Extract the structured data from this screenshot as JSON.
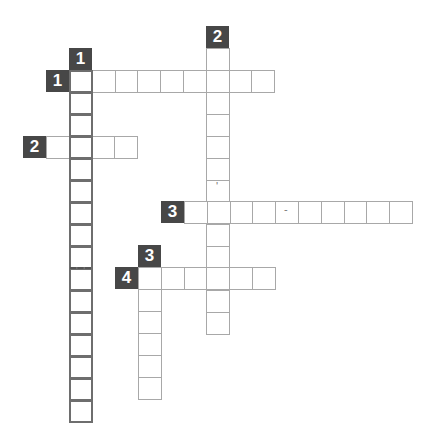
{
  "puzzle": {
    "cell_w": 22.8,
    "cell_h": 22,
    "colors": {
      "label_bg": "#474747",
      "label_fg": "#ffffff",
      "cell_border": "#a8a8a8",
      "dark_border": "#6e6e6e"
    },
    "entries": [
      {
        "id": "1-down",
        "number": "1",
        "direction": "down",
        "label_x": 69,
        "label_y": 48,
        "x": 69,
        "y": 70,
        "length": 16,
        "dark": true
      },
      {
        "id": "1-across",
        "number": "1",
        "direction": "across",
        "label_x": 46,
        "label_y": 70,
        "x": 69,
        "y": 70,
        "length": 9
      },
      {
        "id": "2-down",
        "number": "2",
        "direction": "down",
        "label_x": 206,
        "label_y": 26,
        "x": 206,
        "y": 48,
        "length": 13
      },
      {
        "id": "2-across",
        "number": "2",
        "direction": "across",
        "label_x": 23,
        "label_y": 136,
        "x": 46,
        "y": 136,
        "length": 4
      },
      {
        "id": "3-across",
        "number": "3",
        "direction": "across",
        "label_x": 161,
        "label_y": 201,
        "x": 184,
        "y": 201,
        "length": 10
      },
      {
        "id": "3-down",
        "number": "3",
        "direction": "down",
        "label_x": 138,
        "label_y": 245,
        "x": 138,
        "y": 267,
        "length": 6
      },
      {
        "id": "4-across",
        "number": "4",
        "direction": "across",
        "label_x": 115,
        "label_y": 267,
        "x": 138,
        "y": 267,
        "length": 6
      }
    ],
    "marks": [
      {
        "type": "apostrophe",
        "text": "'",
        "x": 216,
        "y": 181
      },
      {
        "type": "hyphen",
        "text": "-",
        "x": 284,
        "y": 204
      }
    ],
    "dashed_dividers": [
      {
        "x": 70,
        "y": 267,
        "width": 21
      }
    ]
  }
}
